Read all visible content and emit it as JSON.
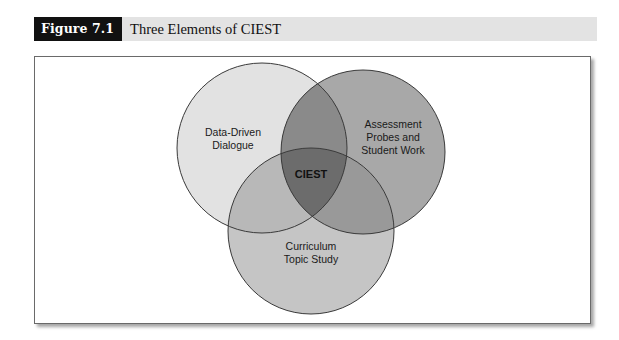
{
  "figure": {
    "label": "Figure 7.1",
    "title": "Three Elements of CIEST"
  },
  "diagram": {
    "type": "venn",
    "sets": [
      {
        "id": "ddd",
        "lines": [
          "Data-Driven",
          "Dialogue"
        ],
        "fill": "#e2e2e2"
      },
      {
        "id": "apsw",
        "lines": [
          "Assessment",
          "Probes and",
          "Student Work"
        ],
        "fill": "#a8a8a8"
      },
      {
        "id": "cts",
        "lines": [
          "Curriculum",
          "Topic Study"
        ],
        "fill": "#c5c5c5"
      }
    ],
    "intersections": {
      "ddd_apsw_fill": "#8a8a8a",
      "ddd_cts_fill": "#b8b8b8",
      "apsw_cts_fill": "#999999",
      "center_fill": "#6c6c6c"
    },
    "center_label": "CIEST"
  }
}
